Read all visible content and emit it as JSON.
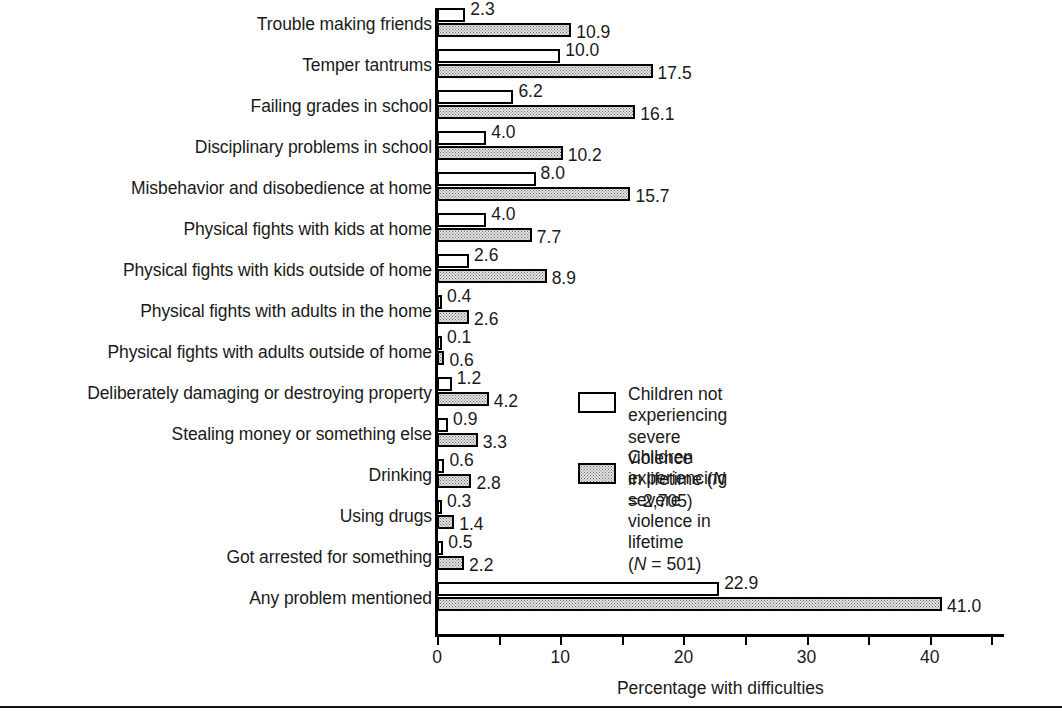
{
  "chart_data": {
    "type": "bar",
    "orientation": "horizontal",
    "title": "",
    "xlabel": "Percentage with difficulties",
    "ylabel": "",
    "xlim": [
      0,
      46
    ],
    "xticks": [
      0,
      5,
      10,
      15,
      20,
      25,
      30,
      35,
      40,
      45
    ],
    "xtick_labels": [
      "0",
      "",
      "10",
      "",
      "20",
      "",
      "30",
      "",
      "40",
      ""
    ],
    "grid": false,
    "legend_position": "center-right",
    "categories": [
      "Trouble making friends",
      "Temper tantrums",
      "Failing grades in school",
      "Disciplinary problems in school",
      "Misbehavior and disobedience at home",
      "Physical fights with kids at home",
      "Physical fights with kids outside of home",
      "Physical fights with adults in the home",
      "Physical fights with adults outside of home",
      "Deliberately damaging or destroying property",
      "Stealing money or something else",
      "Drinking",
      "Using drugs",
      "Got arrested for something",
      "Any problem mentioned"
    ],
    "series": [
      {
        "name": "Children not experiencing severe violence in lifetime (N = 2,705)",
        "style": "white",
        "values": [
          2.3,
          10.0,
          6.2,
          4.0,
          8.0,
          4.0,
          2.6,
          0.4,
          0.1,
          1.2,
          0.9,
          0.6,
          0.3,
          0.5,
          22.9
        ],
        "labels": [
          "2.3",
          "10.0",
          "6.2",
          "4.0",
          "8.0",
          "4.0",
          "2.6",
          "0.4",
          "0.1",
          "1.2",
          "0.9",
          "0.6",
          "0.3",
          "0.5",
          "22.9"
        ]
      },
      {
        "name": "Children experiencing severe violence in lifetime (N = 501)",
        "style": "stipple",
        "values": [
          10.9,
          17.5,
          16.1,
          10.2,
          15.7,
          7.7,
          8.9,
          2.6,
          0.6,
          4.2,
          3.3,
          2.8,
          1.4,
          2.2,
          41.0
        ],
        "labels": [
          "10.9",
          "17.5",
          "16.1",
          "10.2",
          "15.7",
          "7.7",
          "8.9",
          "2.6",
          "0.6",
          "4.2",
          "3.3",
          "2.8",
          "1.4",
          "2.2",
          "41.0"
        ]
      }
    ]
  },
  "legend": {
    "entries": [
      {
        "swatch": "white",
        "line1": "Children not experiencing severe violence",
        "line2_pre": "in lifetime (",
        "line2_italic": "N",
        "line2_post": " = 2,705)"
      },
      {
        "swatch": "stipple",
        "line1": "Children experiencing severe violence in lifetime",
        "line2_pre": "(",
        "line2_italic": "N",
        "line2_post": " = 501)"
      }
    ]
  },
  "axis": {
    "title": "Percentage with difficulties"
  }
}
